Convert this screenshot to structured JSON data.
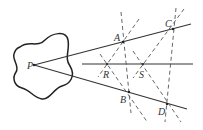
{
  "diagram": {
    "labels": {
      "P": "P",
      "A": "A",
      "B": "B",
      "C": "C",
      "D": "D",
      "R": "R",
      "S": "S"
    },
    "points": {
      "P": [
        34,
        65
      ],
      "A": [
        123,
        42
      ],
      "B": [
        129,
        92
      ],
      "C": [
        173,
        29
      ],
      "D": [
        167,
        104
      ],
      "R": [
        107,
        64
      ],
      "S": [
        143,
        64
      ]
    },
    "colors": {
      "line": "#333333",
      "dashed": "#555555",
      "background": "#ffffff"
    }
  }
}
